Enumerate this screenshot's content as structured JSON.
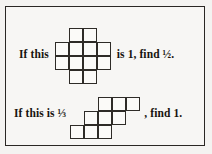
{
  "page": {
    "background_color": "#f4f3f1",
    "frame_color": "#2a2724",
    "ink_color": "#17140f",
    "grid_line_color": "#2e2b27",
    "cell_fill_color": "#fbfaf8"
  },
  "problems": [
    {
      "id": "problem-1",
      "lead_text": "If this",
      "tail_text": "is 1, find ½.",
      "given_value": "1",
      "find_value": "½",
      "figure": {
        "name": "cross-polyomino",
        "cell_size": 14,
        "columns": 4,
        "rows": 4,
        "cells": [
          [
            1,
            0
          ],
          [
            2,
            0
          ],
          [
            0,
            1
          ],
          [
            1,
            1
          ],
          [
            2,
            1
          ],
          [
            3,
            1
          ],
          [
            0,
            2
          ],
          [
            1,
            2
          ],
          [
            2,
            2
          ],
          [
            3,
            2
          ],
          [
            1,
            3
          ],
          [
            2,
            3
          ]
        ],
        "cell_count": 12
      }
    },
    {
      "id": "problem-2",
      "lead_text": "If this is ⅓",
      "tail_text": ", find 1.",
      "given_value": "⅓",
      "find_value": "1",
      "figure": {
        "name": "staircase-polyomino",
        "cell_size": 14,
        "columns": 5,
        "rows": 3,
        "cells": [
          [
            2,
            0
          ],
          [
            3,
            0
          ],
          [
            4,
            0
          ],
          [
            1,
            1
          ],
          [
            2,
            1
          ],
          [
            3,
            1
          ],
          [
            0,
            2
          ],
          [
            1,
            2
          ],
          [
            2,
            2
          ]
        ],
        "cell_count": 9
      }
    }
  ]
}
